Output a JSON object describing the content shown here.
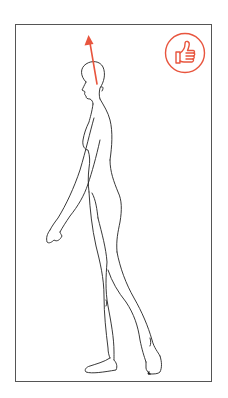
{
  "illustration": {
    "subject": "walking-woman-side-view",
    "indicator_arrow": {
      "direction": "up",
      "color": "#e8553e"
    },
    "badge": {
      "icon": "thumbs-up-icon",
      "color": "#e8553e",
      "meaning": "correct-posture"
    }
  },
  "colors": {
    "frame_border": "#555555",
    "line_art": "#222222",
    "accent": "#e8553e",
    "background": "#ffffff"
  }
}
